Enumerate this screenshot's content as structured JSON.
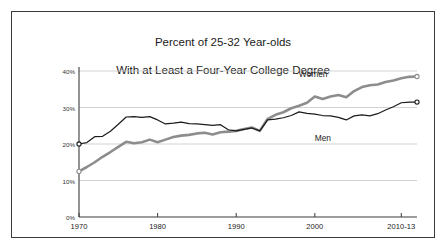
{
  "chart_data": {
    "type": "line",
    "title": "Percent of 25-32 Year-olds\nWith at Least a Four-Year College Degree",
    "title_line1": "Percent of 25-32 Year-olds",
    "title_line2": "With at Least a Four-Year College Degree",
    "xlabel": "",
    "ylabel": "",
    "xlim": [
      1970,
      2013
    ],
    "ylim": [
      0,
      40
    ],
    "grid": true,
    "legend_position": "inline-annotation",
    "yticks": [
      0,
      10,
      20,
      30,
      40
    ],
    "ytick_labels": [
      "0%",
      "10%",
      "20%",
      "30%",
      "40%"
    ],
    "xticks": [
      1970,
      1980,
      1990,
      2000,
      2011
    ],
    "xtick_labels": [
      "1970",
      "1980",
      "1990",
      "2000",
      "2010-13"
    ],
    "colors": {
      "women": "#8d8d8d",
      "men": "#1b1b1b",
      "grid": "#c8c8c8",
      "border": "#3b3b3b",
      "background": "#ffffff"
    },
    "annotations": [
      {
        "text": "Women",
        "x": 2000,
        "y": 39.0
      },
      {
        "text": "Men",
        "x": 2001,
        "y": 21.5
      }
    ],
    "x": [
      1970,
      1971,
      1972,
      1973,
      1974,
      1975,
      1976,
      1977,
      1978,
      1979,
      1980,
      1981,
      1982,
      1983,
      1984,
      1985,
      1986,
      1987,
      1988,
      1989,
      1990,
      1991,
      1992,
      1993,
      1994,
      1995,
      1996,
      1997,
      1998,
      1999,
      2000,
      2001,
      2002,
      2003,
      2004,
      2005,
      2006,
      2007,
      2008,
      2009,
      2010,
      2011,
      2012,
      2013
    ],
    "series": [
      {
        "name": "Men",
        "color": "#1b1b1b",
        "endpoint_markers": true,
        "values": [
          20.0,
          20.4,
          22.0,
          22.1,
          23.5,
          25.4,
          27.4,
          27.5,
          27.3,
          27.5,
          26.6,
          25.5,
          25.7,
          26.0,
          25.6,
          25.5,
          25.3,
          25.1,
          25.3,
          23.9,
          23.6,
          24.0,
          24.4,
          23.6,
          26.6,
          26.8,
          27.2,
          27.8,
          28.8,
          28.4,
          28.2,
          27.8,
          27.7,
          27.3,
          26.6,
          27.7,
          28.0,
          27.7,
          28.3,
          29.3,
          30.2,
          31.3,
          31.5,
          31.5
        ]
      },
      {
        "name": "Women",
        "color": "#8d8d8d",
        "endpoint_markers": true,
        "values": [
          12.5,
          13.7,
          15.0,
          16.5,
          17.8,
          19.2,
          20.6,
          20.2,
          20.5,
          21.2,
          20.5,
          21.2,
          21.9,
          22.3,
          22.5,
          22.9,
          23.1,
          22.6,
          23.2,
          23.4,
          23.6,
          24.1,
          24.5,
          23.6,
          26.9,
          28.0,
          28.7,
          29.8,
          30.5,
          31.3,
          33.0,
          32.3,
          33.0,
          33.4,
          32.8,
          34.5,
          35.6,
          36.1,
          36.3,
          37.0,
          37.4,
          38.0,
          38.4,
          38.5
        ]
      }
    ]
  }
}
